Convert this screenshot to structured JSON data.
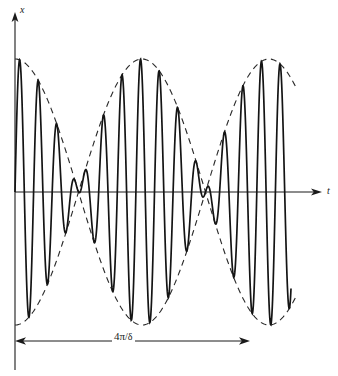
{
  "figure": {
    "type": "physics-waveform-diagram",
    "background_color": "#ffffff",
    "line_color": "#141414",
    "axis_color": "#1a1a1a"
  },
  "axes": {
    "y_axis": {
      "label": "x",
      "italic": true,
      "arrow": "up",
      "x_px": 15,
      "top_px": 14,
      "bottom_px": 370
    },
    "t_axis": {
      "label": "t",
      "italic": true,
      "arrow": "right",
      "y_px": 192,
      "left_px": 15,
      "right_px": 320
    }
  },
  "annotation": {
    "dimension_label_numerator": "4π",
    "dimension_label_slash": "/",
    "dimension_label_denominator": "δ",
    "dimension_label_full": "4π/δ",
    "meaning": "beat period, two envelope cycles",
    "line_y_px": 341,
    "start_px": 15,
    "end_px": 250,
    "arrows": "both"
  },
  "chart_data": {
    "type": "line",
    "title": "",
    "xlabel": "t",
    "ylabel": "x",
    "grid": false,
    "legend": null,
    "series": [
      {
        "name": "beat-waveform",
        "style": "solid",
        "formula": "x = A*cos(delta*t/2)*sin(omega*t)",
        "carrier_period_px": 18.6,
        "amplitude_px": 133,
        "baseline_px": 192
      },
      {
        "name": "envelope-upper",
        "style": "dashed",
        "formula": "x = +A*cos(delta*t/2)"
      },
      {
        "name": "envelope-lower",
        "style": "dashed",
        "formula": "x = -A*cos(delta*t/2)"
      }
    ],
    "nodes_px": [
      15,
      142,
      262
    ],
    "antinodes_px": [
      78,
      202
    ],
    "envelope_top_px": 58,
    "envelope_bottom_px": 325,
    "wave_start_px": 15,
    "wave_end_px": 291,
    "envelope_end_px": 296,
    "xlim_px": [
      15,
      320
    ],
    "ylim_px": [
      58,
      325
    ]
  }
}
